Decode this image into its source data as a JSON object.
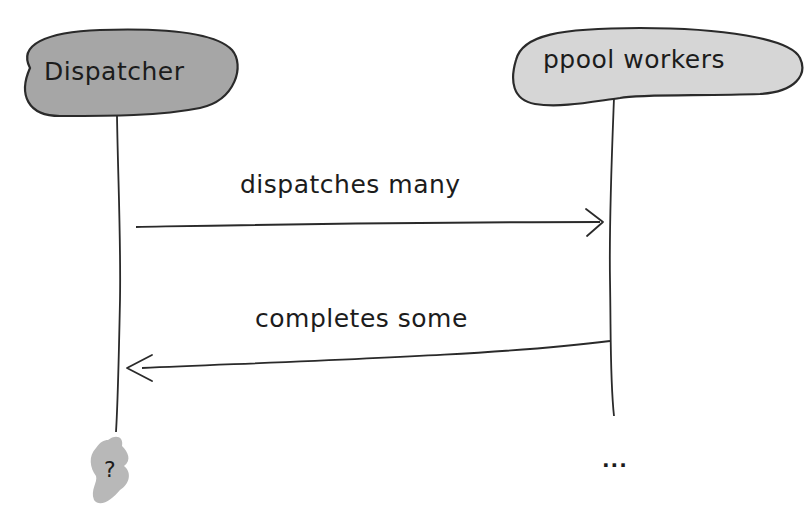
{
  "diagram": {
    "type": "sequence",
    "style": "hand-drawn",
    "colors": {
      "actor_fill_dispatcher": "#a6a6a6",
      "actor_fill_workers": "#d6d6d6",
      "stroke": "#2a2a2a",
      "unknown_blob": "#b8b8b8",
      "background": "#ffffff"
    },
    "actors": [
      {
        "id": "dispatcher",
        "label": "Dispatcher"
      },
      {
        "id": "workers",
        "label": "ppool workers"
      }
    ],
    "messages": [
      {
        "from": "dispatcher",
        "to": "workers",
        "label": "dispatches many"
      },
      {
        "from": "workers",
        "to": "dispatcher",
        "label": "completes some"
      }
    ],
    "lifeline_ends": {
      "dispatcher": "?",
      "workers": "..."
    }
  }
}
